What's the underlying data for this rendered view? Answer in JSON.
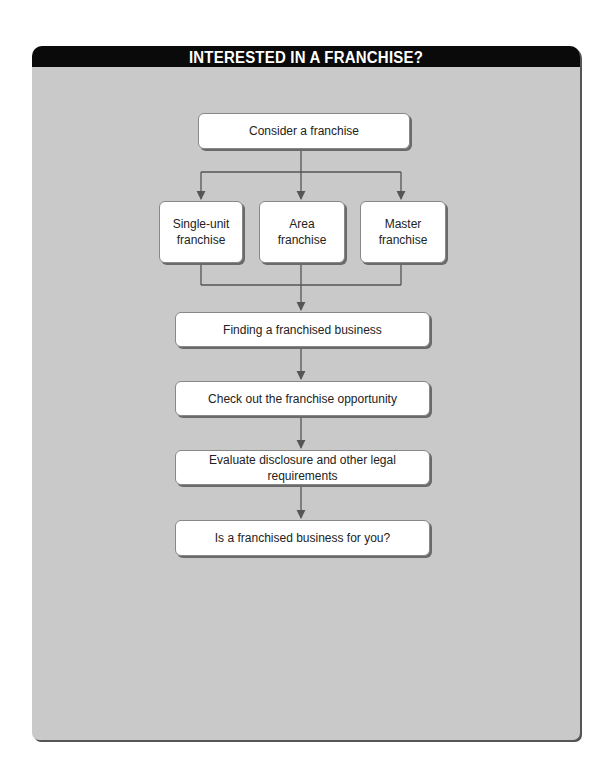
{
  "title": "INTERESTED IN A FRANCHISE?",
  "flowchart": {
    "start": "Consider a franchise",
    "branches": [
      {
        "label": "Single-unit franchise",
        "line1": "Single-unit",
        "line2": "franchise"
      },
      {
        "label": "Area franchise",
        "line1": "Area",
        "line2": "franchise"
      },
      {
        "label": "Master franchise",
        "line1": "Master",
        "line2": "franchise"
      }
    ],
    "steps": [
      "Finding a franchised business",
      "Check out the franchise opportunity",
      "Evaluate disclosure and other legal requirements",
      "Is a franchised business for you?"
    ]
  },
  "colors": {
    "panel_bg": "#c9c9c9",
    "header_bg": "#0a0a0a",
    "header_text": "#ffffff",
    "box_bg": "#ffffff",
    "line": "#555555"
  }
}
